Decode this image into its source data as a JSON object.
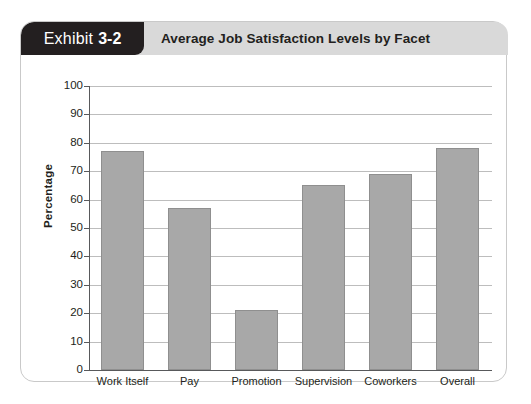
{
  "exhibit": {
    "tag_word": "Exhibit",
    "tag_number": "3-2",
    "title": "Average Job Satisfaction Levels by Facet",
    "tag_background": "#231f20",
    "band_background": "#d9d9d9"
  },
  "chart_data": {
    "type": "bar",
    "title": "Average Job Satisfaction Levels by Facet",
    "xlabel": "",
    "ylabel": "Percentage",
    "ylim": [
      0,
      100
    ],
    "ytick_step": 10,
    "yticks": [
      "100",
      "90",
      "80",
      "70",
      "60",
      "50",
      "40",
      "30",
      "20",
      "10",
      "0"
    ],
    "grid": true,
    "legend": null,
    "bar_color": "#a8a8a8",
    "categories": [
      "Work Itself",
      "Pay",
      "Promotion",
      "Supervision",
      "Coworkers",
      "Overall"
    ],
    "values": [
      77,
      57,
      21,
      65,
      69,
      78
    ]
  }
}
